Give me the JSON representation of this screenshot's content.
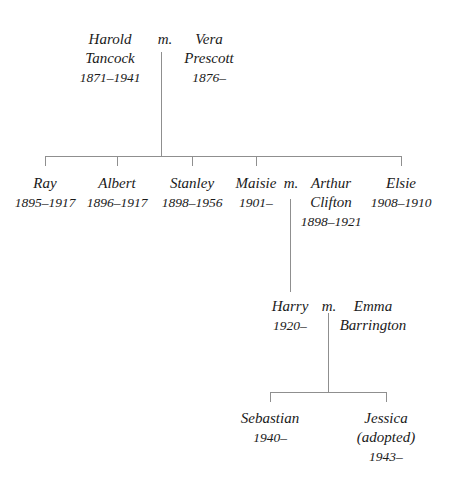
{
  "marriage_label": "m.",
  "generation1": {
    "husband": {
      "given": "Harold",
      "surname": "Tancock",
      "dates": "1871–1941"
    },
    "wife": {
      "given": "Vera",
      "surname": "Prescott",
      "dates": "1876–"
    }
  },
  "generation2": {
    "children": [
      {
        "name": "Ray",
        "dates": "1895–1917"
      },
      {
        "name": "Albert",
        "dates": "1896–1917"
      },
      {
        "name": "Stanley",
        "dates": "1898–1956"
      },
      {
        "name": "Maisie",
        "dates": "1901–"
      },
      {
        "name": "Elsie",
        "dates": "1908–1910"
      }
    ],
    "spouse_of_maisie": {
      "given": "Arthur",
      "surname": "Clifton",
      "dates": "1898–1921"
    }
  },
  "generation3": {
    "child": {
      "name": "Harry",
      "dates": "1920–"
    },
    "spouse": {
      "given": "Emma",
      "surname": "Barrington"
    }
  },
  "generation4": {
    "children": [
      {
        "name": "Sebastian",
        "dates": "1940–"
      },
      {
        "name": "Jessica",
        "note": "(adopted)",
        "dates": "1943–"
      }
    ]
  },
  "colors": {
    "text": "#1a1a1a",
    "lines": "#8f8f8f",
    "background": "#ffffff"
  }
}
